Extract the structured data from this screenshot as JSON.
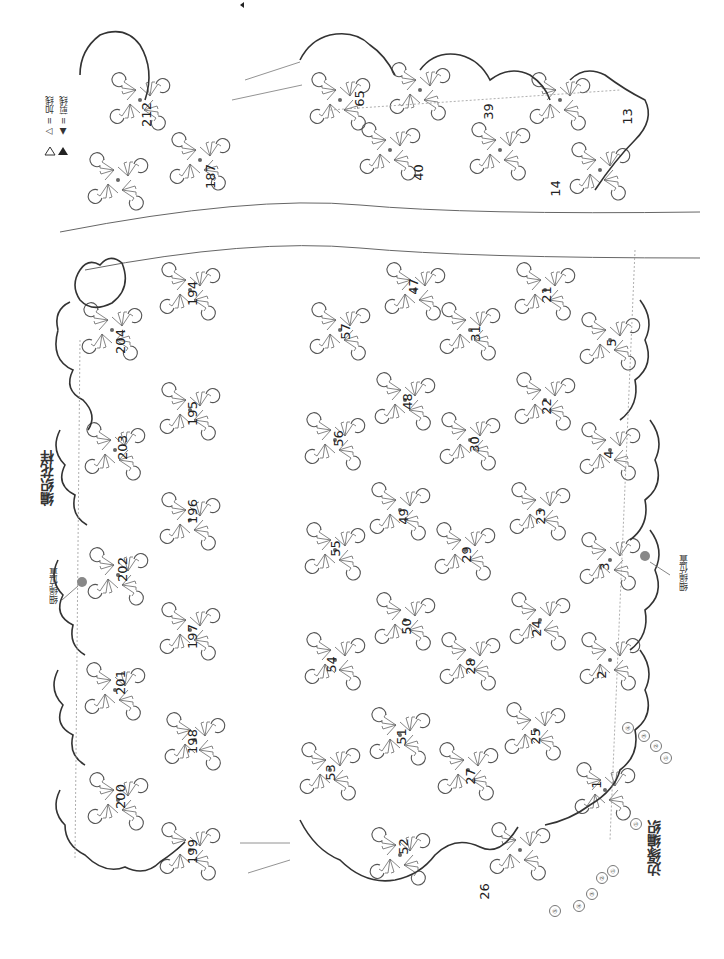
{
  "legend": {
    "join_yarn_symbol": "▷",
    "join_yarn_label": "= 加线",
    "cut_yarn_symbol": "▲",
    "cut_yarn_label": "= 剪线"
  },
  "titles": {
    "pattern": "编织花样",
    "edging": "边缘编织",
    "cord_position_top": "细绳位置",
    "cord_position_right": "细绳位置"
  },
  "motif_numbers": {
    "top_strip": [
      "212",
      "187",
      "65",
      "40",
      "39",
      "14",
      "13"
    ],
    "left_column_outer": [
      "204",
      "203",
      "202",
      "201",
      "200",
      "199"
    ],
    "left_column_inner": [
      "194",
      "195",
      "196",
      "197",
      "198"
    ],
    "middle_outer": [
      "57",
      "56",
      "55",
      "54",
      "53",
      "52"
    ],
    "middle_inner": [
      "47",
      "48",
      "49",
      "50",
      "51"
    ],
    "center": [
      "31",
      "30",
      "29",
      "28",
      "27",
      "26"
    ],
    "right_inner": [
      "21",
      "22",
      "23",
      "24",
      "25"
    ],
    "right_outer": [
      "5",
      "4",
      "3",
      "2",
      "1"
    ]
  },
  "edging_round_markers": {
    "right_side": [
      "①",
      "②",
      "③",
      "④"
    ],
    "bottom_side": [
      "①",
      "②",
      "③",
      "④",
      "⑤"
    ],
    "lower_right": [
      "①"
    ]
  },
  "colors": {
    "line": "#555555",
    "outline": "#333333",
    "cord_dot": "#888888"
  }
}
